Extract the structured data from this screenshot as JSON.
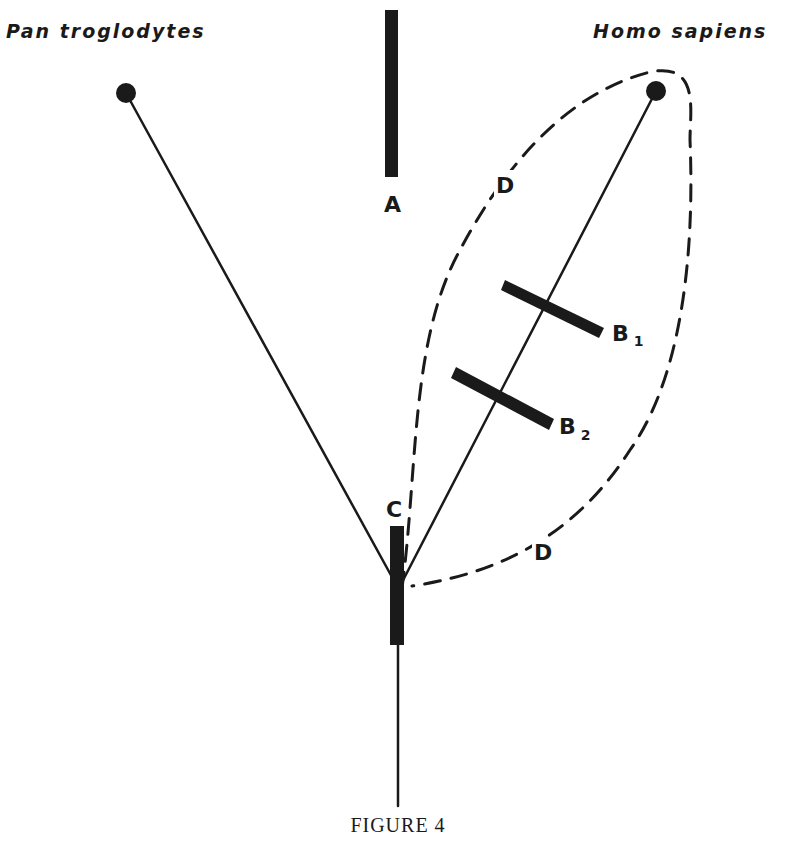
{
  "figure": {
    "caption": "FIGURE 4",
    "ink_color": "#1a1a1a",
    "background_color": "#ffffff"
  },
  "taxa": {
    "left": {
      "label": "Pan troglodytes"
    },
    "right": {
      "label": "Homo sapiens"
    }
  },
  "markers": {
    "A": {
      "label": "A"
    },
    "B1": {
      "label": "B",
      "subscript": "1"
    },
    "B2": {
      "label": "B",
      "subscript": "2"
    },
    "C": {
      "label": "C"
    },
    "D_upper": {
      "label": "D"
    },
    "D_lower": {
      "label": "D"
    }
  }
}
